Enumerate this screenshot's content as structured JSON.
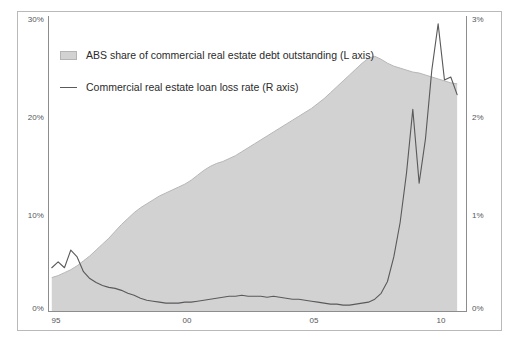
{
  "chart_data": {
    "type": "area",
    "title": "",
    "subtitle": "",
    "xlabel": "",
    "ylabel": "",
    "grid": false,
    "legend_position": "top-left",
    "x_ticks": [
      "95",
      "00",
      "05",
      "10"
    ],
    "x_tick_values": [
      1995,
      2000,
      2005,
      2010
    ],
    "xlim": [
      1994.6,
      2011.1
    ],
    "left_axis": {
      "label": "ABS share of commercial real estate debt outstanding",
      "ticks": [
        "0%",
        "10%",
        "20%",
        "30%"
      ],
      "tick_values": [
        0,
        10,
        20,
        30
      ],
      "ylim": [
        0,
        30
      ],
      "unit": "%"
    },
    "right_axis": {
      "label": "Commercial real estate loan loss rate",
      "ticks": [
        "0%",
        "1%",
        "2%",
        "3%"
      ],
      "tick_values": [
        0,
        1,
        2,
        3
      ],
      "ylim": [
        0,
        3
      ],
      "unit": "%"
    },
    "series": [
      {
        "name": "ABS share of commercial real estate debt outstanding (L axis)",
        "axis": "left",
        "type": "area",
        "color": "#d2d2d2",
        "edge_color": "#b7b7b7",
        "x": [
          1994.75,
          1995.0,
          1995.25,
          1995.5,
          1995.75,
          1996.0,
          1996.25,
          1996.5,
          1996.75,
          1997.0,
          1997.25,
          1997.5,
          1997.75,
          1998.0,
          1998.25,
          1998.5,
          1998.75,
          1999.0,
          1999.25,
          1999.5,
          1999.75,
          2000.0,
          2000.25,
          2000.5,
          2000.75,
          2001.0,
          2001.25,
          2001.5,
          2001.75,
          2002.0,
          2002.25,
          2002.5,
          2002.75,
          2003.0,
          2003.25,
          2003.5,
          2003.75,
          2004.0,
          2004.25,
          2004.5,
          2004.75,
          2005.0,
          2005.25,
          2005.5,
          2005.75,
          2006.0,
          2006.25,
          2006.5,
          2006.75,
          2007.0,
          2007.25,
          2007.5,
          2007.75,
          2008.0,
          2008.25,
          2008.5,
          2008.75,
          2009.0,
          2009.25,
          2009.5,
          2009.75,
          2010.0,
          2010.25,
          2010.5,
          2010.75
        ],
        "values": [
          3.4,
          3.6,
          3.9,
          4.2,
          4.6,
          5.1,
          5.6,
          6.2,
          6.8,
          7.4,
          8.1,
          8.8,
          9.4,
          10.0,
          10.5,
          10.9,
          11.3,
          11.7,
          12.0,
          12.3,
          12.6,
          12.9,
          13.3,
          13.8,
          14.3,
          14.7,
          15.0,
          15.2,
          15.5,
          15.8,
          16.2,
          16.6,
          17.0,
          17.4,
          17.8,
          18.2,
          18.6,
          19.0,
          19.4,
          19.8,
          20.2,
          20.6,
          21.1,
          21.6,
          22.2,
          22.8,
          23.4,
          24.0,
          24.6,
          25.2,
          25.7,
          25.9,
          25.6,
          25.2,
          24.9,
          24.7,
          24.5,
          24.3,
          24.2,
          24.0,
          23.8,
          23.6,
          23.4,
          23.2,
          23.1
        ]
      },
      {
        "name": "Commercial real estate loan loss rate (R axis)",
        "axis": "right",
        "type": "line",
        "color": "#5a5a5a",
        "x": [
          1994.75,
          1995.0,
          1995.25,
          1995.5,
          1995.75,
          1996.0,
          1996.25,
          1996.5,
          1996.75,
          1997.0,
          1997.25,
          1997.5,
          1997.75,
          1998.0,
          1998.25,
          1998.5,
          1998.75,
          1999.0,
          1999.25,
          1999.5,
          1999.75,
          2000.0,
          2000.25,
          2000.5,
          2000.75,
          2001.0,
          2001.25,
          2001.5,
          2001.75,
          2002.0,
          2002.25,
          2002.5,
          2002.75,
          2003.0,
          2003.25,
          2003.5,
          2003.75,
          2004.0,
          2004.25,
          2004.5,
          2004.75,
          2005.0,
          2005.25,
          2005.5,
          2005.75,
          2006.0,
          2006.25,
          2006.5,
          2006.75,
          2007.0,
          2007.25,
          2007.5,
          2007.75,
          2008.0,
          2008.25,
          2008.5,
          2008.75,
          2009.0,
          2009.25,
          2009.5,
          2009.75,
          2010.0,
          2010.25,
          2010.5,
          2010.75
        ],
        "values": [
          0.44,
          0.5,
          0.44,
          0.62,
          0.55,
          0.4,
          0.33,
          0.29,
          0.26,
          0.24,
          0.23,
          0.21,
          0.18,
          0.16,
          0.13,
          0.11,
          0.1,
          0.09,
          0.08,
          0.08,
          0.08,
          0.09,
          0.09,
          0.1,
          0.11,
          0.12,
          0.13,
          0.14,
          0.15,
          0.15,
          0.16,
          0.15,
          0.15,
          0.15,
          0.14,
          0.15,
          0.14,
          0.13,
          0.12,
          0.12,
          0.11,
          0.1,
          0.09,
          0.08,
          0.07,
          0.07,
          0.06,
          0.06,
          0.07,
          0.08,
          0.09,
          0.12,
          0.18,
          0.3,
          0.55,
          0.9,
          1.4,
          2.05,
          1.3,
          1.75,
          2.45,
          2.92,
          2.35,
          2.38,
          2.2
        ]
      }
    ]
  },
  "legend": {
    "items": [
      {
        "marker": "area-swatch",
        "label": "ABS share of commercial real estate debt outstanding (L axis)"
      },
      {
        "marker": "line-swatch",
        "label": "Commercial real estate loan loss rate (R axis)"
      }
    ]
  },
  "axis_labels": {
    "left": [
      "30%",
      "20%",
      "10%",
      "0%"
    ],
    "right": [
      "3%",
      "2%",
      "1%",
      "0%"
    ],
    "bottom": [
      "95",
      "00",
      "05",
      "10"
    ]
  },
  "colors": {
    "area_fill": "#d2d2d2",
    "area_edge": "#b7b7b7",
    "line": "#5a5a5a",
    "axis": "#8d8d8d",
    "frame": "#b9b9b9",
    "tick_text": "#55565a",
    "legend_text": "#2b2b2b"
  }
}
